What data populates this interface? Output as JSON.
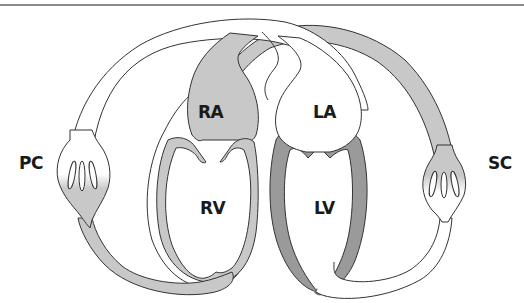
{
  "diagram": {
    "type": "circulation-schematic",
    "colors": {
      "deoxygenated_fill": "#c8c8c8",
      "left_heart_wall": "#9a9a9a",
      "oxygenated_fill": "#ffffff",
      "outline": "#333333",
      "top_rule": "#8a8a8a"
    },
    "labels": {
      "pulmonary_capillaries": "PC",
      "systemic_capillaries": "SC",
      "right_atrium": "RA",
      "left_atrium": "LA",
      "right_ventricle": "RV",
      "left_ventricle": "LV"
    },
    "nodes": [
      {
        "id": "PC",
        "label": "PC",
        "side": "left"
      },
      {
        "id": "SC",
        "label": "SC",
        "side": "right"
      },
      {
        "id": "RA",
        "label": "RA",
        "fill": "gray"
      },
      {
        "id": "RV",
        "label": "RV",
        "fill": "gray"
      },
      {
        "id": "LA",
        "label": "LA",
        "fill": "white"
      },
      {
        "id": "LV",
        "label": "LV",
        "fill": "white"
      }
    ],
    "edges": [
      {
        "from": "RA",
        "to": "RV"
      },
      {
        "from": "RV",
        "to": "PC"
      },
      {
        "from": "PC",
        "to": "LA"
      },
      {
        "from": "LA",
        "to": "LV"
      },
      {
        "from": "LV",
        "to": "SC"
      },
      {
        "from": "SC",
        "to": "RA"
      }
    ]
  }
}
